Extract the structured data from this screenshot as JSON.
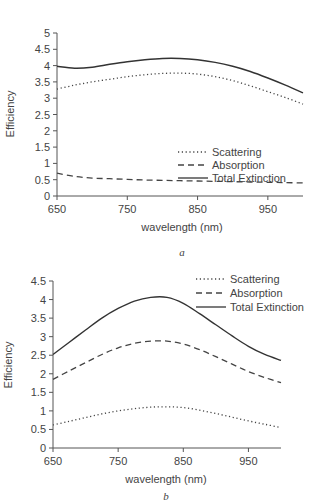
{
  "chart_data": [
    {
      "id": "a",
      "type": "line",
      "panel_label": "a",
      "title": "",
      "xlabel": "wavelength (nm)",
      "ylabel": "Efficiency",
      "xlim": [
        650,
        1000
      ],
      "ylim": [
        0,
        5
      ],
      "xticks": [
        650,
        750,
        850,
        950
      ],
      "xtick_labels": [
        "650",
        "750",
        "850",
        "950"
      ],
      "yticks": [
        0,
        0.5,
        1,
        1.5,
        2,
        2.5,
        3,
        3.5,
        4,
        4.5,
        5
      ],
      "ytick_labels": [
        "0",
        "0.5",
        "1",
        "1.5",
        "2",
        "2.5",
        "3",
        "3.5",
        "4",
        "4.5",
        "5"
      ],
      "grid": false,
      "legend_position": "center-right",
      "x": [
        650,
        675,
        700,
        725,
        750,
        775,
        800,
        825,
        850,
        875,
        900,
        925,
        950,
        975,
        1000
      ],
      "series": [
        {
          "name": "Scattering",
          "style": "dotted",
          "values": [
            3.28,
            3.4,
            3.5,
            3.58,
            3.66,
            3.72,
            3.76,
            3.77,
            3.74,
            3.66,
            3.54,
            3.38,
            3.2,
            3.02,
            2.82
          ]
        },
        {
          "name": "Absorption",
          "style": "dashed",
          "values": [
            0.7,
            0.6,
            0.55,
            0.53,
            0.51,
            0.49,
            0.48,
            0.47,
            0.46,
            0.45,
            0.44,
            0.43,
            0.42,
            0.41,
            0.4
          ]
        },
        {
          "name": "Total Extinction",
          "style": "solid",
          "values": [
            3.98,
            3.92,
            3.95,
            4.04,
            4.12,
            4.18,
            4.22,
            4.22,
            4.18,
            4.1,
            3.98,
            3.82,
            3.62,
            3.4,
            3.16
          ]
        }
      ]
    },
    {
      "id": "b",
      "type": "line",
      "panel_label": "b",
      "title": "",
      "xlabel": "wavelength (nm)",
      "ylabel": "Efficiency",
      "xlim": [
        650,
        1000
      ],
      "ylim": [
        0,
        4.5
      ],
      "xticks": [
        650,
        750,
        850,
        950
      ],
      "xtick_labels": [
        "650",
        "750",
        "850",
        "950"
      ],
      "yticks": [
        0,
        0.5,
        1,
        1.5,
        2,
        2.5,
        3,
        3.5,
        4,
        4.5
      ],
      "ytick_labels": [
        "0",
        "0.5",
        "1",
        "1.5",
        "2",
        "2.5",
        "3",
        "3.5",
        "4",
        "4.5"
      ],
      "grid": false,
      "legend_position": "top-right",
      "x": [
        650,
        675,
        700,
        725,
        750,
        775,
        800,
        825,
        850,
        875,
        900,
        925,
        950,
        975,
        1000
      ],
      "series": [
        {
          "name": "Scattering",
          "style": "dotted",
          "values": [
            0.62,
            0.72,
            0.82,
            0.92,
            1.0,
            1.06,
            1.1,
            1.11,
            1.09,
            1.02,
            0.93,
            0.83,
            0.73,
            0.64,
            0.55
          ]
        },
        {
          "name": "Absorption",
          "style": "dashed",
          "values": [
            1.85,
            2.08,
            2.3,
            2.52,
            2.7,
            2.82,
            2.88,
            2.88,
            2.8,
            2.65,
            2.46,
            2.26,
            2.06,
            1.9,
            1.76
          ]
        },
        {
          "name": "Total Extinction",
          "style": "solid",
          "values": [
            2.52,
            2.85,
            3.18,
            3.5,
            3.76,
            3.96,
            4.06,
            4.06,
            3.9,
            3.62,
            3.32,
            3.02,
            2.74,
            2.52,
            2.36
          ]
        }
      ]
    }
  ]
}
